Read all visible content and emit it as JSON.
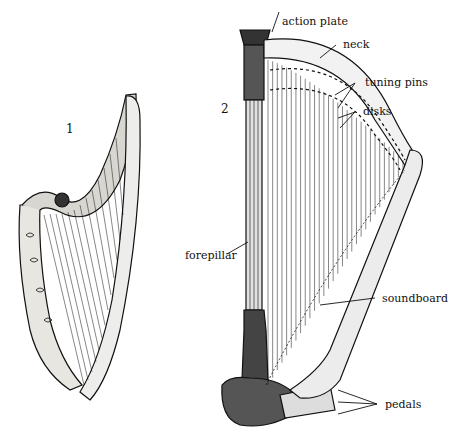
{
  "figures": [
    {
      "number": "1",
      "description": "small harp (early single-action style)"
    },
    {
      "number": "2",
      "description": "pedal harp (concert harp)"
    }
  ],
  "labels": {
    "action_plate": "action plate",
    "neck": "neck",
    "tuning_pins": "tuning pins",
    "disks": "disks",
    "forepillar": "forepillar",
    "soundboard": "soundboard",
    "pedals": "pedals"
  },
  "colors": {
    "ink": "#111111",
    "paper": "#ffffff"
  }
}
